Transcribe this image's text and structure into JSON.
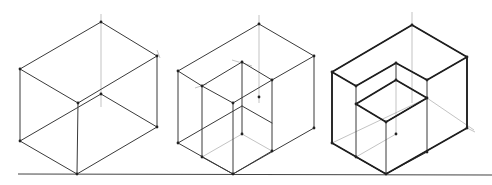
{
  "diagram": {
    "title": "",
    "colors": {
      "ink": "#3a3a3a",
      "construction": "#9a9a9a",
      "background": "#ffffff"
    },
    "ground_line": {
      "x1": 18,
      "y1": 174,
      "x2": 492,
      "y2": 175
    },
    "figures": [
      {
        "name": "plain-box",
        "edges": [
          [
            101,
            22,
            20,
            69
          ],
          [
            101,
            22,
            157,
            56
          ],
          [
            20,
            69,
            78,
            103
          ],
          [
            157,
            56,
            78,
            103
          ],
          [
            20,
            69,
            20,
            141
          ],
          [
            157,
            56,
            157,
            127
          ],
          [
            78,
            103,
            77,
            174
          ],
          [
            20,
            141,
            77,
            174
          ],
          [
            157,
            127,
            77,
            174
          ],
          [
            20,
            141,
            101,
            94
          ],
          [
            157,
            127,
            101,
            94
          ]
        ],
        "construction": [
          [
            101,
            14,
            101,
            107
          ],
          [
            157,
            50,
            160,
            58
          ]
        ],
        "vertices": [
          [
            101,
            22
          ],
          [
            20,
            69
          ],
          [
            157,
            56
          ],
          [
            78,
            103
          ],
          [
            101,
            94
          ],
          [
            20,
            141
          ],
          [
            157,
            127
          ],
          [
            77,
            174
          ]
        ]
      },
      {
        "name": "box-with-cut",
        "edges": [
          [
            259,
            24,
            178,
            71
          ],
          [
            259,
            24,
            314,
            56
          ],
          [
            178,
            71,
            178,
            143
          ],
          [
            314,
            56,
            314,
            128
          ],
          [
            178,
            143,
            233,
            174
          ],
          [
            314,
            128,
            233,
            174
          ],
          [
            178,
            71,
            202,
            86
          ],
          [
            202,
            86,
            233,
            103
          ],
          [
            233,
            103,
            272,
            80
          ],
          [
            272,
            80,
            314,
            56
          ],
          [
            202,
            86,
            242,
            62
          ],
          [
            242,
            62,
            272,
            80
          ],
          [
            202,
            86,
            202,
            157
          ],
          [
            233,
            103,
            233,
            174
          ],
          [
            272,
            80,
            272,
            151
          ],
          [
            202,
            157,
            233,
            174
          ],
          [
            233,
            174,
            272,
            151
          ],
          [
            178,
            143,
            242,
            106
          ],
          [
            242,
            106,
            272,
            123
          ],
          [
            242,
            62,
            242,
            134
          ]
        ],
        "construction": [
          [
            259,
            15,
            259,
            103
          ],
          [
            202,
            157,
            242,
            134
          ],
          [
            242,
            134,
            272,
            151
          ],
          [
            232,
            60,
            252,
            66
          ],
          [
            195,
            88,
            207,
            84
          ]
        ],
        "vertices": [
          [
            259,
            24
          ],
          [
            178,
            71
          ],
          [
            314,
            56
          ],
          [
            202,
            86
          ],
          [
            233,
            103
          ],
          [
            272,
            80
          ],
          [
            242,
            62
          ],
          [
            178,
            143
          ],
          [
            314,
            128
          ],
          [
            202,
            157
          ],
          [
            233,
            174
          ],
          [
            272,
            151
          ],
          [
            242,
            134
          ],
          [
            259,
            97
          ]
        ]
      },
      {
        "name": "box-with-inset-cube",
        "edges": [
          [
            412,
            25,
            332,
            72
          ],
          [
            412,
            25,
            467,
            57
          ],
          [
            332,
            72,
            332,
            143
          ],
          [
            467,
            57,
            467,
            128
          ],
          [
            332,
            143,
            386,
            174
          ],
          [
            467,
            128,
            386,
            174
          ],
          [
            332,
            72,
            356,
            86
          ],
          [
            356,
            86,
            396,
            63
          ],
          [
            396,
            63,
            427,
            80
          ],
          [
            427,
            80,
            467,
            57
          ],
          [
            356,
            86,
            356,
            157
          ],
          [
            427,
            80,
            427,
            152
          ],
          [
            356,
            157,
            386,
            174
          ],
          [
            386,
            174,
            427,
            152
          ],
          [
            356,
            104,
            396,
            80
          ],
          [
            396,
            80,
            427,
            98
          ],
          [
            356,
            104,
            386,
            122
          ],
          [
            386,
            122,
            427,
            98
          ],
          [
            386,
            122,
            386,
            174
          ],
          [
            396,
            63,
            396,
            80
          ],
          [
            427,
            98,
            386,
            122
          ]
        ],
        "thick_edges": [
          [
            412,
            25,
            332,
            72
          ],
          [
            412,
            25,
            467,
            57
          ],
          [
            332,
            72,
            332,
            143
          ],
          [
            467,
            57,
            467,
            128
          ],
          [
            332,
            143,
            386,
            174
          ],
          [
            467,
            128,
            386,
            174
          ],
          [
            332,
            72,
            356,
            86
          ],
          [
            356,
            86,
            396,
            63
          ],
          [
            396,
            63,
            427,
            80
          ],
          [
            427,
            80,
            467,
            57
          ],
          [
            356,
            104,
            396,
            80
          ],
          [
            396,
            80,
            427,
            98
          ],
          [
            356,
            104,
            386,
            122
          ],
          [
            386,
            122,
            427,
            98
          ]
        ],
        "construction": [
          [
            412,
            12,
            412,
            103
          ],
          [
            332,
            143,
            427,
            98
          ],
          [
            356,
            157,
            396,
            134
          ],
          [
            467,
            128,
            475,
            132
          ],
          [
            396,
            134,
            396,
            80
          ],
          [
            427,
            98,
            474,
            130
          ]
        ],
        "vertices": [
          [
            412,
            25
          ],
          [
            332,
            72
          ],
          [
            467,
            57
          ],
          [
            356,
            86
          ],
          [
            396,
            63
          ],
          [
            427,
            80
          ],
          [
            356,
            104
          ],
          [
            396,
            80
          ],
          [
            427,
            98
          ],
          [
            386,
            122
          ],
          [
            332,
            143
          ],
          [
            467,
            128
          ],
          [
            356,
            157
          ],
          [
            386,
            174
          ],
          [
            427,
            152
          ],
          [
            396,
            134
          ]
        ]
      }
    ]
  }
}
